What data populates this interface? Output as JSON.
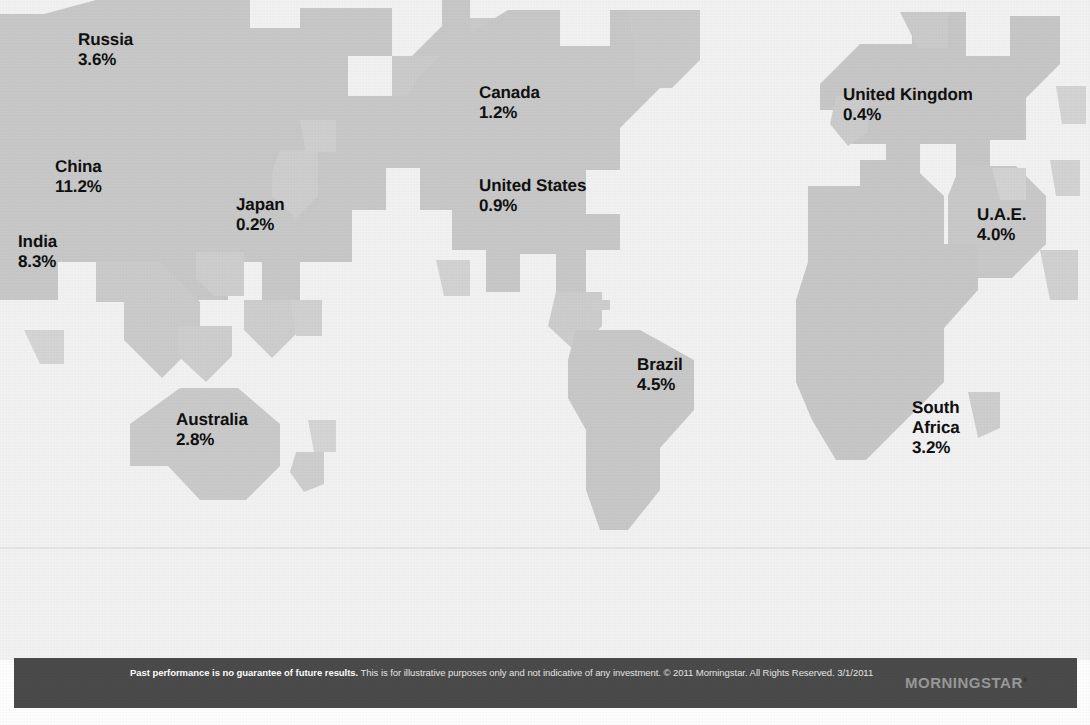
{
  "graphic": {
    "type": "world-map-infographic",
    "land_color": "#c9c9c9",
    "land_color_alt": "#d2d2d2",
    "ocean_color": "#f3f3f3",
    "label_color": "#111111",
    "footer_bg": "#4b4b4b",
    "footer_text_color": "#e6e6e6"
  },
  "chart_data": {
    "type": "map",
    "title": "",
    "unit": "%",
    "categories": [
      "Russia",
      "China",
      "Japan",
      "India",
      "Australia",
      "Canada",
      "United States",
      "Brazil",
      "United Kingdom",
      "U.A.E.",
      "South Africa"
    ],
    "values": [
      3.6,
      11.2,
      0.2,
      8.3,
      2.8,
      1.2,
      0.9,
      4.5,
      0.4,
      4.0,
      3.2
    ],
    "labels": [
      "3.6%",
      "11.2%",
      "0.2%",
      "8.3%",
      "2.8%",
      "1.2%",
      "0.9%",
      "4.5%",
      "0.4%",
      "4.0%",
      "3.2%"
    ]
  },
  "labels": [
    {
      "id": "russia",
      "name": "Russia",
      "value": "3.6%",
      "x": 78,
      "y": 30
    },
    {
      "id": "china",
      "name": "China",
      "value": "11.2%",
      "x": 55,
      "y": 157
    },
    {
      "id": "japan",
      "name": "Japan",
      "value": "0.2%",
      "x": 236,
      "y": 195
    },
    {
      "id": "india",
      "name": "India",
      "value": "8.3%",
      "x": 18,
      "y": 232
    },
    {
      "id": "australia",
      "name": "Australia",
      "value": "2.8%",
      "x": 176,
      "y": 410
    },
    {
      "id": "canada",
      "name": "Canada",
      "value": "1.2%",
      "x": 479,
      "y": 83
    },
    {
      "id": "united-states",
      "name": "United States",
      "value": "0.9%",
      "x": 479,
      "y": 176
    },
    {
      "id": "brazil",
      "name": "Brazil",
      "value": "4.5%",
      "x": 637,
      "y": 355
    },
    {
      "id": "united-kingdom",
      "name": "United Kingdom",
      "value": "0.4%",
      "x": 843,
      "y": 85
    },
    {
      "id": "uae",
      "name": "U.A.E.",
      "value": "4.0%",
      "x": 977,
      "y": 205
    },
    {
      "id": "south-africa",
      "name": "South\nAfrica",
      "value": "3.2%",
      "x": 912,
      "y": 398
    }
  ],
  "footer": {
    "bold_lead": "Past performance is no guarantee of future results.",
    "body": " This is for illustrative purposes only and not indicative of any investment. © 2011 Morningstar. All Rights Reserved. 3/1/2011",
    "logo_text": "MORNINGSTAR",
    "logo_tm": "®"
  }
}
